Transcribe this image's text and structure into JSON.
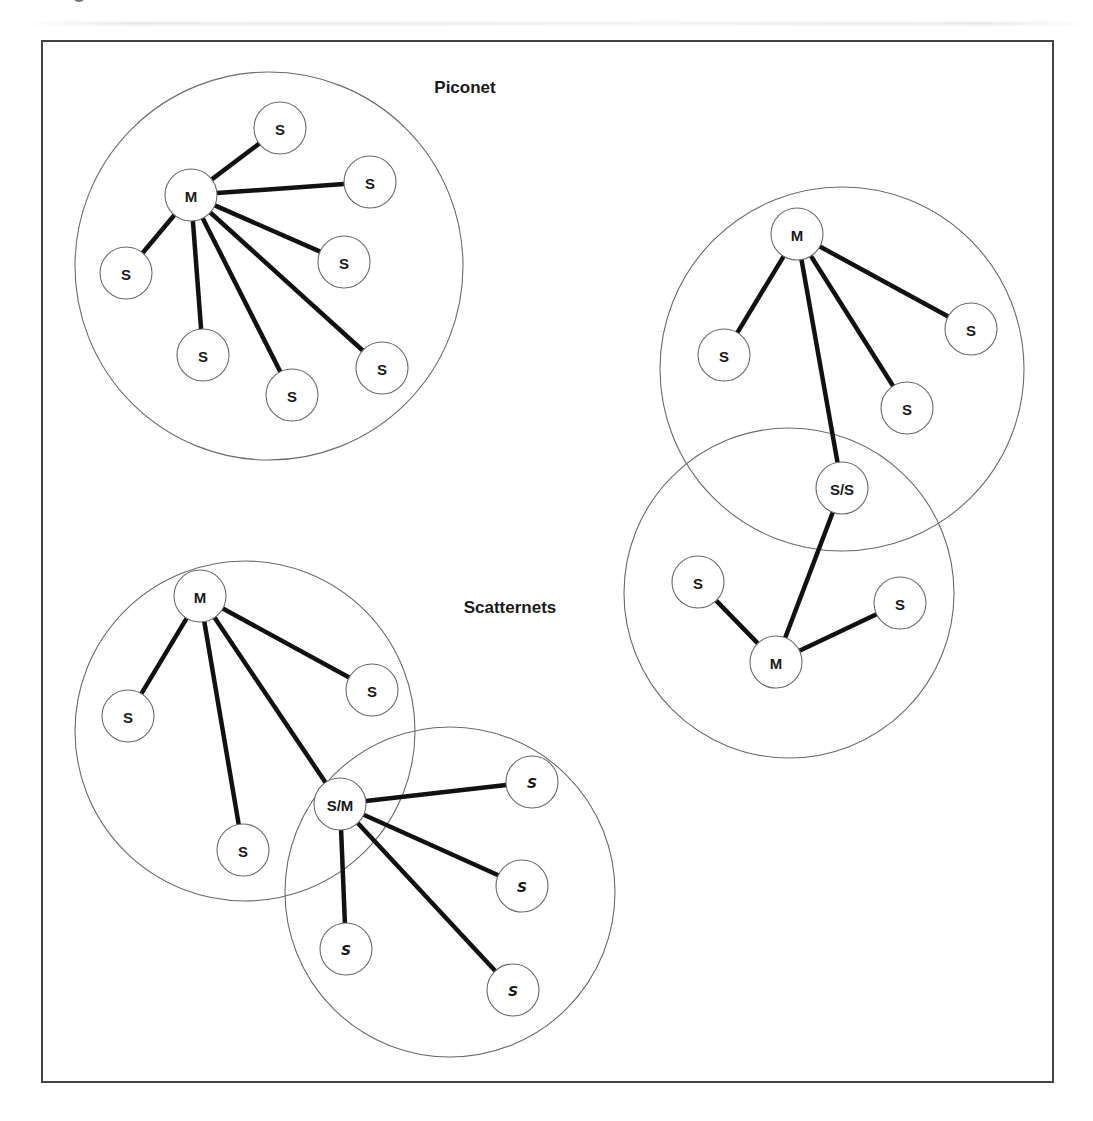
{
  "labels": {
    "piconet": "Piconet",
    "scatternets": "Scatternets"
  },
  "colors": {
    "frame": "#444444",
    "link": "#111111",
    "circle": "#6a6a6a",
    "text": "#1a1a1a",
    "background": "#ffffff"
  },
  "frame": {
    "x": 42,
    "y": 41,
    "width": 1011,
    "height": 1041
  },
  "titles": [
    {
      "key": "piconet",
      "text": "Piconet",
      "x": 465,
      "y": 87
    },
    {
      "key": "scatternets",
      "text": "Scatternets",
      "x": 510,
      "y": 607
    }
  ],
  "networks": [
    {
      "id": "piconet",
      "circles": [
        {
          "cx": 269,
          "cy": 266,
          "r": 194
        }
      ],
      "nodes": [
        {
          "id": "p-m",
          "label": "M",
          "x": 191,
          "y": 195,
          "role": "master"
        },
        {
          "id": "p-s1",
          "label": "S",
          "x": 280,
          "y": 128,
          "role": "slave"
        },
        {
          "id": "p-s2",
          "label": "S",
          "x": 370,
          "y": 182,
          "role": "slave"
        },
        {
          "id": "p-s3",
          "label": "S",
          "x": 344,
          "y": 262,
          "role": "slave"
        },
        {
          "id": "p-s4",
          "label": "S",
          "x": 126,
          "y": 273,
          "role": "slave"
        },
        {
          "id": "p-s5",
          "label": "S",
          "x": 203,
          "y": 355,
          "role": "slave"
        },
        {
          "id": "p-s6",
          "label": "S",
          "x": 292,
          "y": 395,
          "role": "slave"
        },
        {
          "id": "p-s7",
          "label": "S",
          "x": 382,
          "y": 368,
          "role": "slave"
        }
      ],
      "links": [
        [
          "p-m",
          "p-s1"
        ],
        [
          "p-m",
          "p-s2"
        ],
        [
          "p-m",
          "p-s3"
        ],
        [
          "p-m",
          "p-s4"
        ],
        [
          "p-m",
          "p-s5"
        ],
        [
          "p-m",
          "p-s6"
        ],
        [
          "p-m",
          "p-s7"
        ]
      ]
    },
    {
      "id": "scatternet-left",
      "circles": [
        {
          "cx": 245,
          "cy": 731,
          "r": 170
        },
        {
          "cx": 450,
          "cy": 892,
          "r": 165
        }
      ],
      "nodes": [
        {
          "id": "l-m",
          "label": "M",
          "x": 200,
          "y": 596,
          "role": "master"
        },
        {
          "id": "l-s1",
          "label": "S",
          "x": 128,
          "y": 716,
          "role": "slave"
        },
        {
          "id": "l-s2",
          "label": "S",
          "x": 372,
          "y": 690,
          "role": "slave"
        },
        {
          "id": "l-s3",
          "label": "S",
          "x": 243,
          "y": 850,
          "role": "slave"
        },
        {
          "id": "l-sm",
          "label": "S/M",
          "x": 340,
          "y": 804,
          "role": "bridge"
        },
        {
          "id": "l-s4",
          "label": "S",
          "x": 532,
          "y": 782,
          "role": "slave",
          "style": "alt"
        },
        {
          "id": "l-s5",
          "label": "S",
          "x": 522,
          "y": 886,
          "role": "slave",
          "style": "alt"
        },
        {
          "id": "l-s6",
          "label": "S",
          "x": 346,
          "y": 949,
          "role": "slave",
          "style": "alt"
        },
        {
          "id": "l-s7",
          "label": "S",
          "x": 513,
          "y": 990,
          "role": "slave",
          "style": "alt"
        }
      ],
      "links": [
        [
          "l-m",
          "l-s1"
        ],
        [
          "l-m",
          "l-s2"
        ],
        [
          "l-m",
          "l-s3"
        ],
        [
          "l-m",
          "l-sm"
        ],
        [
          "l-sm",
          "l-s4"
        ],
        [
          "l-sm",
          "l-s5"
        ],
        [
          "l-sm",
          "l-s6"
        ],
        [
          "l-sm",
          "l-s7"
        ]
      ]
    },
    {
      "id": "scatternet-right",
      "circles": [
        {
          "cx": 842,
          "cy": 369,
          "r": 182
        },
        {
          "cx": 789,
          "cy": 593,
          "r": 165
        }
      ],
      "nodes": [
        {
          "id": "r-m1",
          "label": "M",
          "x": 797,
          "y": 234,
          "role": "master"
        },
        {
          "id": "r-s1",
          "label": "S",
          "x": 724,
          "y": 355,
          "role": "slave"
        },
        {
          "id": "r-s2",
          "label": "S",
          "x": 971,
          "y": 329,
          "role": "slave"
        },
        {
          "id": "r-s3",
          "label": "S",
          "x": 907,
          "y": 408,
          "role": "slave"
        },
        {
          "id": "r-ss",
          "label": "S/S",
          "x": 842,
          "y": 488,
          "role": "bridge"
        },
        {
          "id": "r-s4",
          "label": "S",
          "x": 698,
          "y": 582,
          "role": "slave"
        },
        {
          "id": "r-s5",
          "label": "S",
          "x": 900,
          "y": 603,
          "role": "slave"
        },
        {
          "id": "r-m2",
          "label": "M",
          "x": 776,
          "y": 662,
          "role": "master"
        }
      ],
      "links": [
        [
          "r-m1",
          "r-s1"
        ],
        [
          "r-m1",
          "r-s2"
        ],
        [
          "r-m1",
          "r-s3"
        ],
        [
          "r-m1",
          "r-ss"
        ],
        [
          "r-ss",
          "r-m2"
        ],
        [
          "r-m2",
          "r-s4"
        ],
        [
          "r-m2",
          "r-s5"
        ]
      ]
    }
  ],
  "node_radius": 26
}
